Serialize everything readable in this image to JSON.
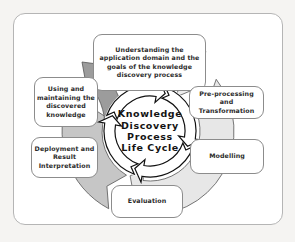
{
  "diagram": {
    "center": {
      "label": "Knowledge\nDiscovery\nProcess\nLife Cycle"
    },
    "stages": [
      {
        "id": "understanding",
        "label": "Understanding the\napplication domain and the\ngoals of the knowledge\ndiscovery process"
      },
      {
        "id": "preprocessing",
        "label": "Pre-processing and\nTransformation"
      },
      {
        "id": "modelling",
        "label": "Modelling"
      },
      {
        "id": "evaluation",
        "label": "Evaluation"
      },
      {
        "id": "deployment",
        "label": "Deployment and\nResult\nInterpretation"
      },
      {
        "id": "using",
        "label": "Using and\nmaintaining the\ndiscovered\nknowledge"
      }
    ],
    "colors": {
      "arrow_light": "#ececec",
      "arrow_light2": "#e7e7e7",
      "arrow_medium": "#c6c6c6",
      "arrow_dark": "#9c9c9c",
      "arrow_outline": "#555555",
      "ring_fill": "#ffffff",
      "ring_outline": "#111111",
      "box_border": "#8c8c8c",
      "frame_border": "#b5b5b5",
      "text": "#2b2b2b"
    }
  }
}
